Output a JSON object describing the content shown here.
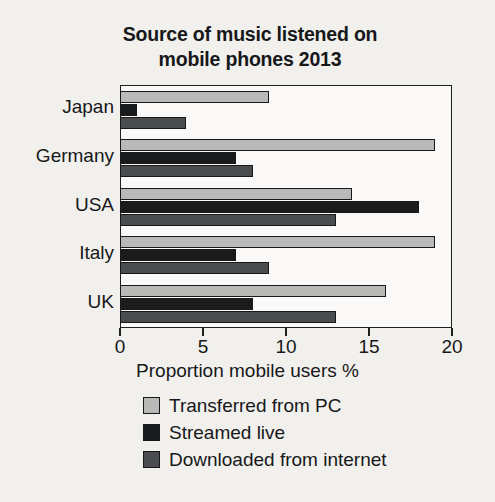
{
  "chart_data": {
    "type": "bar",
    "orientation": "horizontal",
    "title": "Source of music listened on mobile phones 2013",
    "title_lines": [
      "Source of music listened on",
      "mobile phones 2013"
    ],
    "xlabel": "Proportion mobile users %",
    "ylabel": "",
    "categories": [
      "Japan",
      "Germany",
      "USA",
      "Italy",
      "UK"
    ],
    "series": [
      {
        "name": "Transferred from PC",
        "color": "#b9b9b7",
        "values": [
          9,
          19,
          14,
          19,
          16
        ]
      },
      {
        "name": "Streamed live",
        "color": "#191b1c",
        "values": [
          1,
          7,
          18,
          7,
          8
        ]
      },
      {
        "name": "Downloaded from internet",
        "color": "#4a4c4d",
        "values": [
          4,
          8,
          13,
          9,
          13
        ]
      }
    ],
    "xlim": [
      0,
      20
    ],
    "xticks": [
      0,
      5,
      10,
      15,
      20
    ],
    "xtick_labels": [
      "0",
      "5",
      "10",
      "15",
      "20"
    ],
    "grid": false,
    "legend_position": "below"
  }
}
